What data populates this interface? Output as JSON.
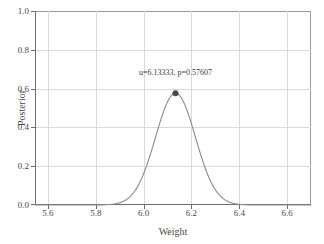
{
  "chart_data": {
    "type": "line",
    "title": "",
    "xlabel": "Weight",
    "ylabel": "Posterior",
    "xlim": [
      5.5458,
      6.7,
      0
    ],
    "ylim": [
      0.0,
      1.0
    ],
    "grid": true,
    "legend": null,
    "x_ticks": [
      "5.6",
      "5.8",
      "6.0",
      "6.2",
      "6.4",
      "6.6"
    ],
    "x_tick_values": [
      5.6,
      5.8,
      6.0,
      6.2,
      6.4,
      6.6
    ],
    "y_ticks": [
      "0.0",
      "0.2",
      "0.4",
      "0.6",
      "0.8",
      "1.0"
    ],
    "y_tick_values": [
      0.0,
      0.2,
      0.4,
      0.6,
      0.8,
      1.0
    ],
    "series": [
      {
        "name": "Posterior",
        "kind": "gaussian-curve",
        "color": "#8a8a8a",
        "mu": 6.13333,
        "peak": 0.57607,
        "sigma": 0.0835
      }
    ],
    "markers": [
      {
        "name": "posterior-mode",
        "x": 6.13333,
        "y": 0.57607,
        "color": "#4a4a4a"
      }
    ],
    "annotations": [
      {
        "name": "mode-annotation",
        "text": "u=6.13333,  p=0.57607",
        "x": 6.13333,
        "y": 0.675
      }
    ]
  },
  "axes": {
    "x": {
      "label": "Weight",
      "ticks": [
        {
          "label": "5.6",
          "value": 5.6
        },
        {
          "label": "5.8",
          "value": 5.8
        },
        {
          "label": "6.0",
          "value": 6.0
        },
        {
          "label": "6.2",
          "value": 6.2
        },
        {
          "label": "6.4",
          "value": 6.4
        },
        {
          "label": "6.6",
          "value": 6.6
        }
      ]
    },
    "y": {
      "label": "Posterior",
      "ticks": [
        {
          "label": "0.0",
          "value": 0.0
        },
        {
          "label": "0.2",
          "value": 0.2
        },
        {
          "label": "0.4",
          "value": 0.4
        },
        {
          "label": "0.6",
          "value": 0.6
        },
        {
          "label": "0.8",
          "value": 0.8
        },
        {
          "label": "1.0",
          "value": 1.0
        }
      ]
    }
  },
  "annotation": {
    "mode_text": "u=6.13333,  p=0.57607"
  },
  "colors": {
    "curve": "#8a8a8a",
    "marker": "#4a4a4a",
    "grid": "#d9d9d9",
    "axis": "#6e6e6e",
    "frame": "#9a9a9a",
    "text": "#4a4a4a",
    "background": "#ffffff"
  }
}
